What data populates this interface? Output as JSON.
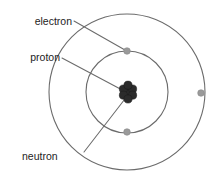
{
  "diagram": {
    "background_color": "#ffffff",
    "width": 211,
    "height": 175,
    "colors": {
      "orbit_stroke": "#6b6b6b",
      "leader_stroke": "#6b6b6b",
      "electron_fill": "#9a9a9a",
      "nucleon_fill": "#2b2b2b",
      "label_text": "#1d1d1d"
    },
    "labels": [
      {
        "id": "electron",
        "text": "electron",
        "text_x": 72,
        "text_y": 22,
        "anchor": "end",
        "leader": {
          "x1": 74,
          "y1": 21,
          "x2": 125,
          "y2": 50
        }
      },
      {
        "id": "proton",
        "text": "proton",
        "text_x": 60,
        "text_y": 58,
        "anchor": "end",
        "leader": {
          "x1": 62,
          "y1": 58,
          "x2": 126,
          "y2": 92
        }
      },
      {
        "id": "neutron",
        "text": "neutron",
        "text_x": 22,
        "text_y": 157,
        "anchor": "start",
        "leader": {
          "x1": 84,
          "y1": 152,
          "x2": 128,
          "y2": 95
        }
      }
    ],
    "nucleus": {
      "center_x": 128,
      "center_y": 92,
      "particle_radius": 4.1,
      "particles": [
        {
          "cx": 128.0,
          "cy": 92.0
        },
        {
          "cx": 123.4,
          "cy": 89.0
        },
        {
          "cx": 132.6,
          "cy": 89.0
        },
        {
          "cx": 123.4,
          "cy": 95.2
        },
        {
          "cx": 132.6,
          "cy": 95.2
        },
        {
          "cx": 128.0,
          "cy": 85.2
        },
        {
          "cx": 128.0,
          "cy": 99.0
        }
      ]
    },
    "orbits": [
      {
        "id": "inner-orbit",
        "name": "inner shell",
        "center_x": 127,
        "center_y": 92,
        "radius": 41
      },
      {
        "id": "outer-orbit",
        "name": "outer shell",
        "center_x": 127,
        "center_y": 92,
        "radius": 78
      }
    ],
    "electrons": [
      {
        "id": "electron-inner-top",
        "cx": 127,
        "cy": 51,
        "r": 3.3,
        "orbit": "inner-orbit"
      },
      {
        "id": "electron-inner-bottom",
        "cx": 127,
        "cy": 132,
        "r": 3.3,
        "orbit": "inner-orbit"
      },
      {
        "id": "electron-outer-right",
        "cx": 201,
        "cy": 93,
        "r": 3.3,
        "orbit": "outer-orbit"
      }
    ]
  }
}
